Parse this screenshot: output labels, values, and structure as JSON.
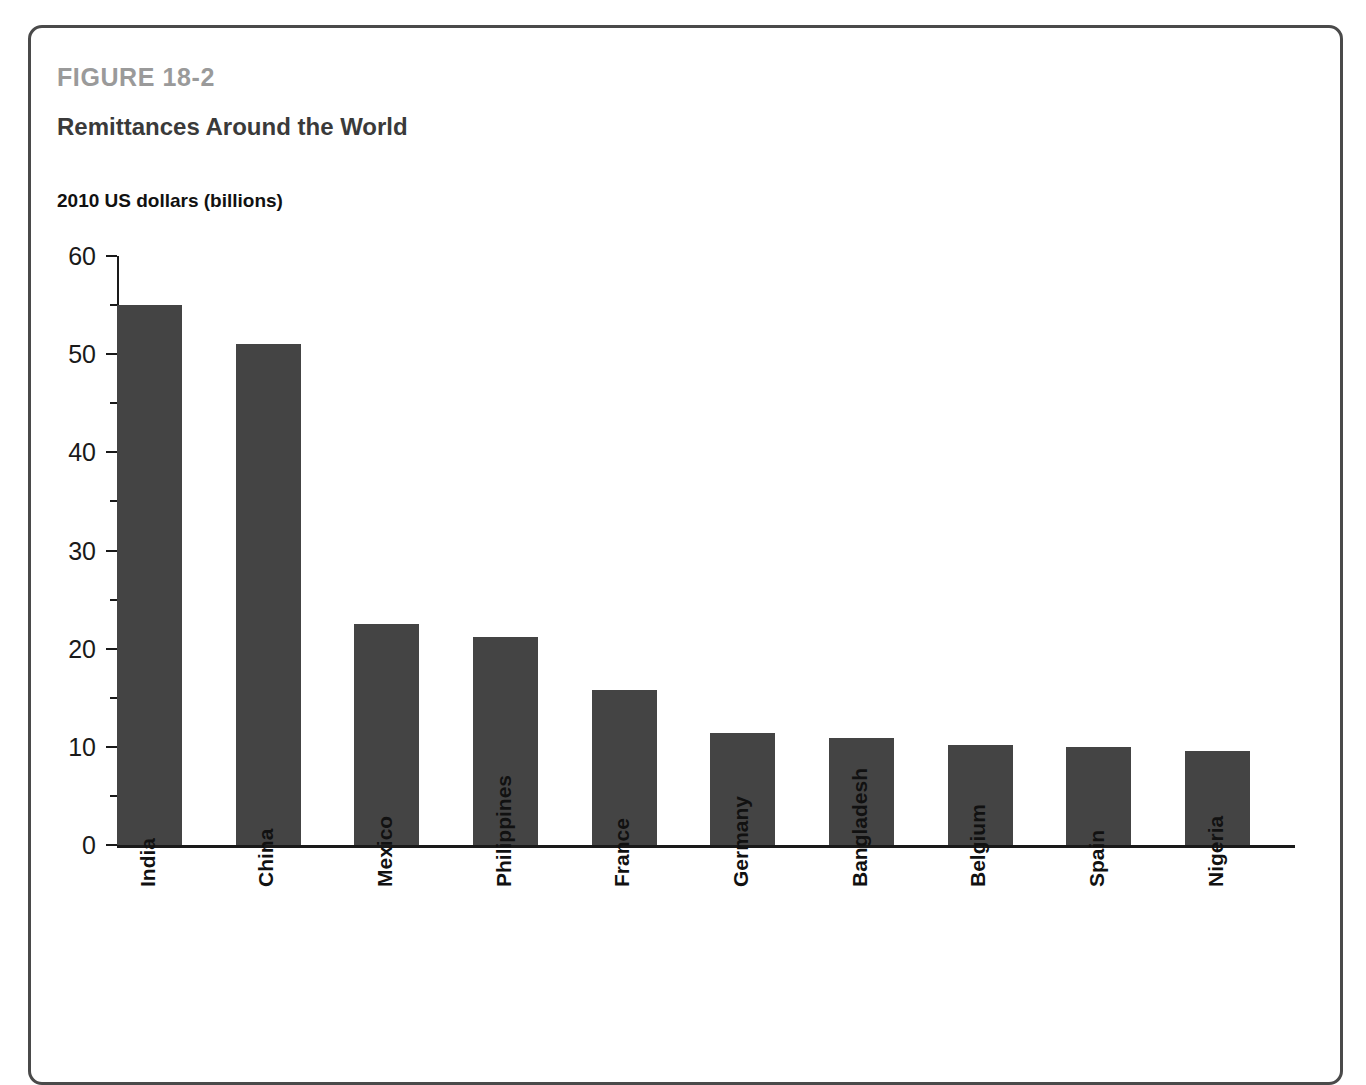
{
  "figure": {
    "number": "FIGURE 18-2",
    "title": "Remittances Around the World"
  },
  "chart_data": {
    "type": "bar",
    "title": "Remittances Around the World",
    "subtitle": "FIGURE 18-2",
    "xlabel": "",
    "ylabel": "2010 US dollars (billions)",
    "ylim": [
      0,
      60
    ],
    "y_major_ticks": [
      0,
      10,
      20,
      30,
      40,
      50,
      60
    ],
    "y_minor_ticks": [
      5,
      15,
      25,
      35,
      45,
      55
    ],
    "grid": false,
    "legend": false,
    "bar_color": "#444444",
    "categories": [
      "India",
      "China",
      "Mexico",
      "Philippines",
      "France",
      "Germany",
      "Bangladesh",
      "Belgium",
      "Spain",
      "Nigeria"
    ],
    "values": [
      55.0,
      51.0,
      22.5,
      21.2,
      15.8,
      11.4,
      10.9,
      10.2,
      10.0,
      9.6
    ]
  }
}
